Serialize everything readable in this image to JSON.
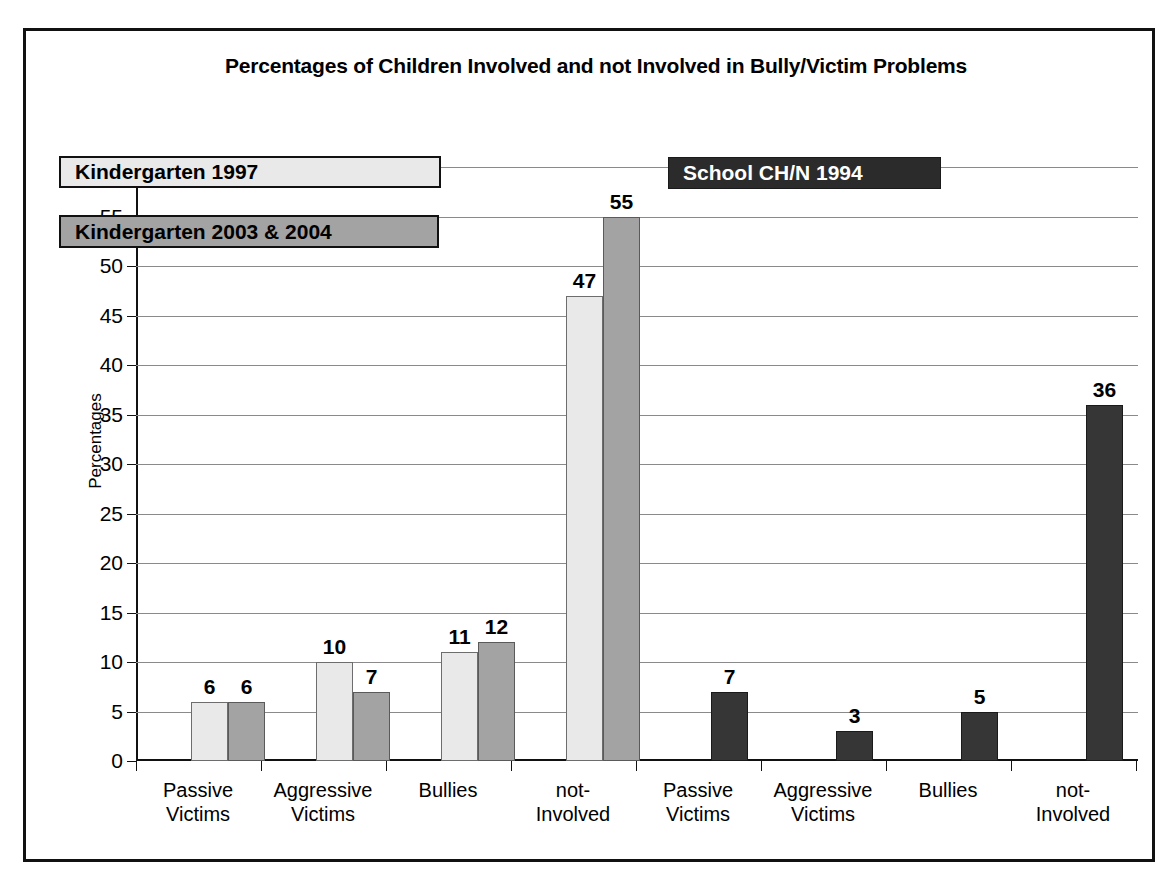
{
  "chart_data": {
    "type": "bar",
    "title": "Percentages of Children Involved and not Involved in Bully/Victim Problems",
    "xlabel": "",
    "ylabel": "Percentages",
    "ylim": [
      0,
      60
    ],
    "ytick_step": 5,
    "yticks": [
      "60",
      "55",
      "50",
      "45",
      "40",
      "35",
      "30",
      "25",
      "20",
      "15",
      "10",
      "5",
      "0"
    ],
    "grid": true,
    "legend_position": "inside-upper-left-and-upper-right",
    "categories": [
      "Passive Victims",
      "Aggressive Victims",
      "Bullies",
      "not-Involved",
      "Passive Victims",
      "Aggressive Victims",
      "Bullies",
      "not-Involved"
    ],
    "series": [
      {
        "name": "Kindergarten 1997",
        "color": "#e9e9e9",
        "values": [
          6,
          10,
          11,
          47,
          null,
          null,
          null,
          null
        ]
      },
      {
        "name": "Kindergarten 2003 & 2004",
        "color": "#a3a3a3",
        "values": [
          6,
          7,
          12,
          55,
          null,
          null,
          null,
          null
        ]
      },
      {
        "name": "School CH/N 1994",
        "color": "#2b2b2b",
        "values": [
          null,
          null,
          null,
          null,
          7,
          3,
          5,
          36
        ]
      }
    ],
    "bars": [
      {
        "group": 0,
        "category": "Passive Victims",
        "series": "Kindergarten 1997",
        "value": 6,
        "label": "6",
        "style": "light",
        "left": 55,
        "width": 37
      },
      {
        "group": 0,
        "category": "Passive Victims",
        "series": "Kindergarten 2003 & 2004",
        "value": 6,
        "label": "6",
        "style": "medium",
        "left": 92,
        "width": 37
      },
      {
        "group": 1,
        "category": "Aggressive Victims",
        "series": "Kindergarten 1997",
        "value": 10,
        "label": "10",
        "style": "light",
        "left": 180,
        "width": 37
      },
      {
        "group": 1,
        "category": "Aggressive Victims",
        "series": "Kindergarten 2003 & 2004",
        "value": 7,
        "label": "7",
        "style": "medium",
        "left": 217,
        "width": 37
      },
      {
        "group": 2,
        "category": "Bullies",
        "series": "Kindergarten 1997",
        "value": 11,
        "label": "11",
        "style": "light",
        "left": 305,
        "width": 37
      },
      {
        "group": 2,
        "category": "Bullies",
        "series": "Kindergarten 2003 & 2004",
        "value": 12,
        "label": "12",
        "style": "medium",
        "left": 342,
        "width": 37
      },
      {
        "group": 3,
        "category": "not-Involved",
        "series": "Kindergarten 1997",
        "value": 47,
        "label": "47",
        "style": "light",
        "left": 430,
        "width": 37
      },
      {
        "group": 3,
        "category": "not-Involved",
        "series": "Kindergarten 2003 & 2004",
        "value": 55,
        "label": "55",
        "style": "medium",
        "left": 467,
        "width": 37
      },
      {
        "group": 4,
        "category": "Passive Victims",
        "series": "School CH/N 1994",
        "value": 7,
        "label": "7",
        "style": "dark",
        "left": 575,
        "width": 37
      },
      {
        "group": 5,
        "category": "Aggressive Victims",
        "series": "School CH/N 1994",
        "value": 3,
        "label": "3",
        "style": "dark",
        "left": 700,
        "width": 37
      },
      {
        "group": 6,
        "category": "Bullies",
        "series": "School CH/N 1994",
        "value": 5,
        "label": "5",
        "style": "dark",
        "left": 825,
        "width": 37
      },
      {
        "group": 7,
        "category": "not-Involved",
        "series": "School CH/N 1994",
        "value": 36,
        "label": "36",
        "style": "dark",
        "left": 950,
        "width": 37
      }
    ],
    "xtick_positions": [
      0,
      125,
      250,
      375,
      500,
      625,
      750,
      875,
      1000
    ],
    "xlabel_positions": [
      62,
      187,
      312,
      437,
      562,
      687,
      812,
      937
    ],
    "xlabels": [
      {
        "line1": "Passive",
        "line2": "Victims"
      },
      {
        "line1": "Aggressive",
        "line2": "Victims"
      },
      {
        "line1": "Bullies",
        "line2": ""
      },
      {
        "line1": "not-",
        "line2": "Involved"
      },
      {
        "line1": "Passive",
        "line2": "Victims"
      },
      {
        "line1": "Aggressive",
        "line2": "Victims"
      },
      {
        "line1": "Bullies",
        "line2": ""
      },
      {
        "line1": "not-",
        "line2": "Involved"
      }
    ]
  },
  "legend": {
    "kindergarten_1997": "Kindergarten 1997",
    "kindergarten_2003_2004": "Kindergarten 2003 & 2004",
    "school_chn_1994": "School CH/N 1994"
  },
  "colors": {
    "light_gray": "#e9e9e9",
    "medium_gray": "#a3a3a3",
    "dark": "#2b2b2b",
    "frame": "#111111",
    "gridline": "#8a8a8a"
  }
}
